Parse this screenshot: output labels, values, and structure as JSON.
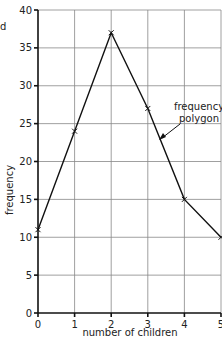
{
  "chart_data": {
    "type": "line",
    "title": "",
    "xlabel": "number of children",
    "ylabel": "frequency",
    "x": [
      0,
      1,
      2,
      3,
      4,
      5
    ],
    "series": [
      {
        "name": "frequency polygon",
        "values": [
          11,
          24,
          37,
          27,
          15,
          10
        ]
      }
    ],
    "xlim": [
      0,
      5
    ],
    "ylim": [
      0,
      40
    ],
    "xticks": [
      "0",
      "1",
      "2",
      "3",
      "4",
      "5"
    ],
    "yticks": [
      "0",
      "5",
      "10",
      "15",
      "20",
      "25",
      "30",
      "35",
      "40"
    ],
    "grid": true,
    "annotations": [
      {
        "text": [
          "frequency",
          "polygon"
        ],
        "arrow_to": "line between x=3 and x=4"
      }
    ],
    "fragment_text": "d"
  }
}
